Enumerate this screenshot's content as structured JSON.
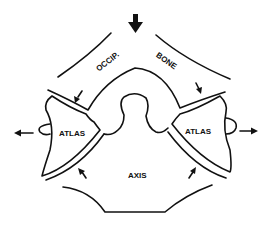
{
  "diagram": {
    "type": "anatomical schematic",
    "labels": {
      "occip": "OCCIP.",
      "bone": "BONE",
      "atlas_left": "ATLAS",
      "atlas_right": "ATLAS",
      "axis": "AXIS"
    },
    "arrows": [
      {
        "id": "top-down",
        "direction": "down",
        "size": "large"
      },
      {
        "id": "upper-left",
        "direction": "down-left"
      },
      {
        "id": "upper-right",
        "direction": "down-right"
      },
      {
        "id": "left-out",
        "direction": "left"
      },
      {
        "id": "right-out",
        "direction": "right"
      },
      {
        "id": "lower-left",
        "direction": "up-left"
      },
      {
        "id": "lower-right",
        "direction": "up-right"
      }
    ],
    "colors": {
      "line": "#111111",
      "background": "#ffffff"
    }
  }
}
